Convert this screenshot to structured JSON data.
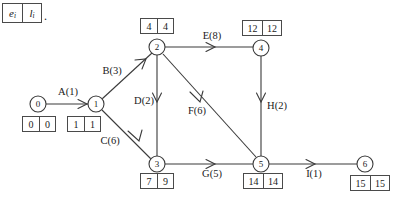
{
  "legend": {
    "left_symbol": "e",
    "left_sub": "i",
    "right_symbol": "l",
    "right_sub": "i",
    "trailing": "."
  },
  "diagram": {
    "type": "activity-on-arrow network diagram",
    "nodes": [
      {
        "id": "0",
        "label": "0",
        "x": 38,
        "y": 104,
        "r": 8,
        "box": {
          "x": 39,
          "y": 124,
          "early": "0",
          "late": "0",
          "wide": false
        }
      },
      {
        "id": "1",
        "label": "1",
        "x": 96,
        "y": 104,
        "r": 8,
        "box": {
          "x": 84,
          "y": 124,
          "early": "1",
          "late": "1",
          "wide": false
        }
      },
      {
        "id": "2",
        "label": "2",
        "x": 157,
        "y": 47,
        "r": 8,
        "box": {
          "x": 157,
          "y": 26,
          "early": "4",
          "late": "4",
          "wide": false
        }
      },
      {
        "id": "3",
        "label": "3",
        "x": 157,
        "y": 164,
        "r": 8,
        "box": {
          "x": 157,
          "y": 181,
          "early": "7",
          "late": "9",
          "wide": false
        }
      },
      {
        "id": "4",
        "label": "4",
        "x": 261,
        "y": 48,
        "r": 8,
        "box": {
          "x": 262,
          "y": 28,
          "early": "12",
          "late": "12",
          "wide": true
        }
      },
      {
        "id": "5",
        "label": "5",
        "x": 261,
        "y": 164,
        "r": 8,
        "box": {
          "x": 263,
          "y": 181,
          "early": "14",
          "late": "14",
          "wide": true
        }
      },
      {
        "id": "6",
        "label": "6",
        "x": 365,
        "y": 164,
        "r": 8,
        "box": {
          "x": 370,
          "y": 183,
          "early": "15",
          "late": "15",
          "wide": true
        }
      }
    ],
    "edges": [
      {
        "id": "A",
        "from": "0",
        "to": "1",
        "label": "A(1)",
        "label_x": 68,
        "label_y": 92
      },
      {
        "id": "B",
        "from": "1",
        "to": "2",
        "label": "B(3)",
        "label_x": 112,
        "label_y": 71
      },
      {
        "id": "C",
        "from": "1",
        "to": "3",
        "label": "C(6)",
        "label_x": 110,
        "label_y": 141
      },
      {
        "id": "D",
        "from": "2",
        "to": "3",
        "label": "D(2)",
        "label_x": 144,
        "label_y": 101
      },
      {
        "id": "E",
        "from": "2",
        "to": "4",
        "label": "E(8)",
        "label_x": 212,
        "label_y": 36
      },
      {
        "id": "F",
        "from": "2",
        "to": "5",
        "label": "F(6)",
        "label_x": 197,
        "label_y": 111
      },
      {
        "id": "G",
        "from": "3",
        "to": "5",
        "label": "G(5)",
        "label_x": 212,
        "label_y": 174
      },
      {
        "id": "H",
        "from": "4",
        "to": "5",
        "label": "H(2)",
        "label_x": 277,
        "label_y": 106
      },
      {
        "id": "I",
        "from": "5",
        "to": "6",
        "label": "I(1)",
        "label_x": 314,
        "label_y": 174
      }
    ]
  },
  "colors": {
    "stroke": "#3a3a3a",
    "text": "#1a1a1a",
    "background": "#ffffff",
    "box_border": "#4a4a4a"
  }
}
